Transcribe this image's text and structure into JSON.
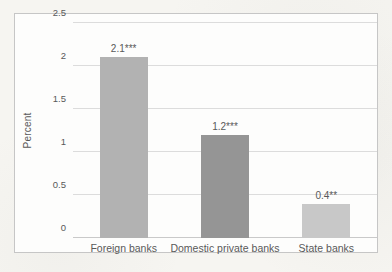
{
  "chart_data": {
    "type": "bar",
    "categories": [
      "Foreign banks",
      "Domestic private banks",
      "State banks"
    ],
    "values": [
      2.1,
      1.2,
      0.4
    ],
    "data_labels": [
      "2.1***",
      "1.2***",
      "0.4**"
    ],
    "bar_colors": [
      "#b2b2b2",
      "#959595",
      "#c8c8c8"
    ],
    "title": "",
    "xlabel": "",
    "ylabel": "Percent",
    "ylim": [
      0,
      2.5
    ],
    "y_ticks": [
      "0",
      "0.5",
      "1",
      "1.5",
      "2",
      "2.5"
    ],
    "grid": true,
    "legend": false,
    "gridline_color": "#dcdcdc",
    "text_color": "#595959"
  }
}
